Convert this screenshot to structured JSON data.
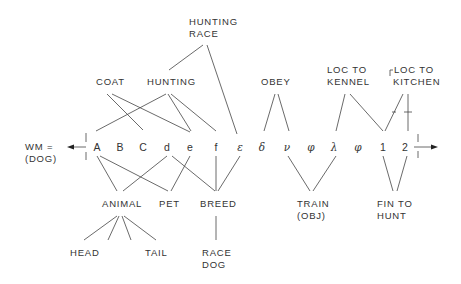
{
  "equation": {
    "lhs_line1": "WM =",
    "lhs_line2": "(DOG)"
  },
  "symbols": [
    "A",
    "B",
    "C",
    "d",
    "e",
    "f",
    "ε",
    "δ",
    "ν",
    "φ",
    "λ",
    "φ",
    "1",
    "2"
  ],
  "upper_labels": {
    "hunting_race_1": "HUNTING",
    "hunting_race_2": "RACE",
    "coat": "COAT",
    "hunting": "HUNTING",
    "obey": "OBEY",
    "loc_kennel_1": "LOC TO",
    "loc_kennel_2": "KENNEL",
    "loc_kitchen_1": "LOC TO",
    "loc_kitchen_2": "KITCHEN"
  },
  "lower_labels": {
    "animal": "ANIMAL",
    "pet": "PET",
    "breed": "BREED",
    "train_1": "TRAIN",
    "train_2": "(OBJ)",
    "fin_1": "FIN TO",
    "fin_2": "HUNT",
    "head": "HEAD",
    "tail": "TAIL",
    "race_dog_1": "RACE",
    "race_dog_2": "DOG"
  },
  "colors": {
    "ink": "#333333",
    "background": "#ffffff"
  }
}
